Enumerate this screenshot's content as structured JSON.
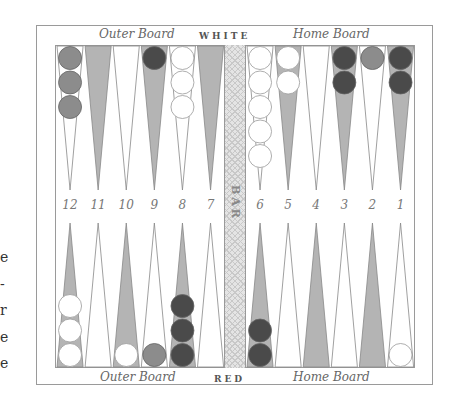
{
  "board": {
    "top_left_label": "Outer Board",
    "top_center_label": "WHITE",
    "top_right_label": "Home Board",
    "bottom_left_label": "Outer Board",
    "bottom_center_label": "RED",
    "bottom_right_label": "Home Board",
    "bar_label": "BAR",
    "point_numbers": [
      "12",
      "11",
      "10",
      "9",
      "8",
      "7",
      "6",
      "5",
      "4",
      "3",
      "2",
      "1"
    ]
  },
  "colors": {
    "light_point": "#ffffff",
    "dark_point": "#b4b4b4",
    "white_checker": "#ffffff",
    "dark_checker": "#4a4a4a",
    "gray_checker": "#8c8c8c",
    "frame": "#9a9a9a"
  },
  "checkers": {
    "top": [
      {
        "point": "12",
        "count": 3,
        "color": "gray"
      },
      {
        "point": "9",
        "count": 1,
        "color": "dark"
      },
      {
        "point": "8",
        "count": 3,
        "color": "white"
      },
      {
        "point": "6",
        "count": 5,
        "color": "white"
      },
      {
        "point": "5",
        "count": 2,
        "color": "white"
      },
      {
        "point": "3",
        "count": 2,
        "color": "dark"
      },
      {
        "point": "2",
        "count": 1,
        "color": "gray"
      },
      {
        "point": "1",
        "count": 2,
        "color": "dark"
      }
    ],
    "bottom": [
      {
        "point": "12",
        "count": 3,
        "color": "white"
      },
      {
        "point": "10",
        "count": 1,
        "color": "white"
      },
      {
        "point": "9",
        "count": 1,
        "color": "gray"
      },
      {
        "point": "8",
        "count": 3,
        "color": "dark"
      },
      {
        "point": "6",
        "count": 2,
        "color": "dark"
      },
      {
        "point": "1",
        "count": 1,
        "color": "white"
      }
    ]
  },
  "edge_fragments": [
    "e",
    "-",
    "r",
    "e",
    "e"
  ]
}
